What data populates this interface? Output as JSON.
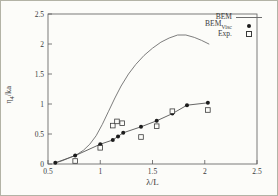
{
  "colors": {
    "ink": "#3a3a3a",
    "frame": "#5a5a5a",
    "bem_curve": "#6e6e6e",
    "bem_visc_line": "#555555",
    "marker_fill": "#1c1c1c",
    "background": "#fcfcf9",
    "figure_border": "#b3b3a6"
  },
  "legend": {
    "items": [
      {
        "label": "BEM",
        "sub": "",
        "marker": "line"
      },
      {
        "label": "BEM",
        "sub": "Visc",
        "marker": "filled-circle"
      },
      {
        "label": "Exp.",
        "sub": "",
        "marker": "open-square"
      }
    ]
  },
  "chart_data": {
    "type": "line",
    "title": "",
    "xlabel": "λ/L",
    "ylabel": "η4/ka",
    "ylabel_parts": {
      "base": "η",
      "sub": "4",
      "rest": "/ka"
    },
    "xlim": [
      0.5,
      2.5
    ],
    "ylim": [
      0,
      2.5
    ],
    "grid": false,
    "legend_position": "top-right",
    "xticks": [
      0.5,
      1,
      1.5,
      2,
      2.5
    ],
    "xtick_labels": [
      "0.5",
      "1",
      "1.5",
      "2",
      "2.5"
    ],
    "yticks": [
      0,
      0.5,
      1,
      1.5,
      2,
      2.5
    ],
    "ytick_labels": [
      "0",
      "0.5",
      "1",
      "1.5",
      "2",
      "2.5"
    ],
    "series": [
      {
        "name": "BEM",
        "style": "line",
        "marker": "none",
        "x": [
          0.57,
          0.63,
          0.7,
          0.77,
          0.84,
          0.9,
          0.96,
          1.02,
          1.08,
          1.14,
          1.2,
          1.27,
          1.34,
          1.42,
          1.5,
          1.58,
          1.66,
          1.74,
          1.82,
          1.9,
          1.97,
          2.04
        ],
        "y": [
          0.02,
          0.05,
          0.1,
          0.15,
          0.23,
          0.33,
          0.47,
          0.66,
          0.88,
          1.1,
          1.3,
          1.5,
          1.66,
          1.81,
          1.93,
          2.03,
          2.1,
          2.15,
          2.15,
          2.11,
          2.06,
          2.0
        ]
      },
      {
        "name": "BEM_Visc",
        "style": "line+marker",
        "marker": "filled-circle",
        "x": [
          0.57,
          0.76,
          1.0,
          1.12,
          1.17,
          1.22,
          1.39,
          1.54,
          1.69,
          1.83,
          2.03
        ],
        "y": [
          0.02,
          0.14,
          0.33,
          0.4,
          0.46,
          0.52,
          0.62,
          0.72,
          0.84,
          0.98,
          1.02
        ]
      },
      {
        "name": "Exp.",
        "style": "marker",
        "marker": "open-square",
        "x": [
          0.76,
          1.0,
          1.12,
          1.16,
          1.21,
          1.39,
          1.54,
          1.69,
          2.03
        ],
        "y": [
          0.05,
          0.27,
          0.64,
          0.71,
          0.68,
          0.45,
          0.63,
          0.88,
          0.9
        ]
      }
    ]
  }
}
